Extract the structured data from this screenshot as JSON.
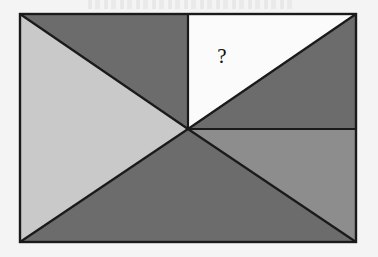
{
  "figure": {
    "title": "",
    "question_label": "?",
    "canvas": {
      "width": 378,
      "height": 257,
      "background": "#f4f4f4"
    },
    "rectangle": {
      "left": 20,
      "top": 14,
      "right": 356,
      "bottom": 242,
      "stroke": "#1a1a1a",
      "stroke_width": 2.2
    },
    "center_point": {
      "x": 188,
      "y": 129
    },
    "colors": {
      "light_gray": "#c9c9c9",
      "medium_gray": "#8d8d8d",
      "dark_gray": "#6c6c6c",
      "white": "#fbfbfb",
      "outline": "#1a1a1a",
      "page_background": "#f4f4f4"
    },
    "regions": [
      {
        "name": "top-left-lower-triangle",
        "shade": "light_gray",
        "points": "20,14 188,129 20,242"
      },
      {
        "name": "top-left-upper-triangle",
        "shade": "dark_gray",
        "points": "20,14 188,14 188,129"
      },
      {
        "name": "top-right-upper-triangle",
        "shade": "white",
        "points": "188,14 356,14 188,129"
      },
      {
        "name": "top-right-lower-triangle",
        "shade": "dark_gray",
        "points": "356,14 356,129 188,129"
      },
      {
        "name": "bottom-left-triangle",
        "shade": "dark_gray",
        "points": "20,242 188,129 356,242"
      },
      {
        "name": "bottom-right-upper-triangle",
        "shade": "medium_gray",
        "points": "188,129 356,129 356,242"
      }
    ],
    "segments": [
      {
        "name": "diagonal-topleft-to-center",
        "x1": 20,
        "y1": 14,
        "x2": 188,
        "y2": 129
      },
      {
        "name": "diagonal-bottomleft-to-center",
        "x1": 20,
        "y1": 242,
        "x2": 188,
        "y2": 129
      },
      {
        "name": "diagonal-topright-to-center",
        "x1": 356,
        "y1": 14,
        "x2": 188,
        "y2": 129
      },
      {
        "name": "diagonal-bottomright-to-center",
        "x1": 356,
        "y1": 242,
        "x2": 188,
        "y2": 129
      },
      {
        "name": "vertical-top-to-center",
        "x1": 188,
        "y1": 14,
        "x2": 188,
        "y2": 129
      },
      {
        "name": "horizontal-center-to-right",
        "x1": 188,
        "y1": 129,
        "x2": 356,
        "y2": 129
      }
    ],
    "question_mark_position": {
      "x": 222,
      "y": 63
    }
  }
}
